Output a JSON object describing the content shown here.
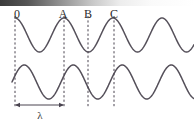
{
  "figure": {
    "width": 194,
    "height": 123,
    "background": "#ffffff",
    "stroke_color": "#55505a",
    "dash_color": "#4a4450",
    "text_color": "#2c2c2c",
    "top_band": {
      "name": "page-edge-shadow",
      "from": "#3a3a3a",
      "to": "#ffffff",
      "height": 6
    }
  },
  "labels": [
    {
      "text": "0",
      "x": 17,
      "y": 8
    },
    {
      "text": "A",
      "x": 63,
      "y": 8
    },
    {
      "text": "B",
      "x": 88,
      "y": 8
    },
    {
      "text": "C",
      "x": 114,
      "y": 8
    }
  ],
  "dashed_lines": [
    {
      "name": "marker-0",
      "x": 15,
      "y1": 16,
      "y2": 108
    },
    {
      "name": "marker-A",
      "x": 64,
      "y1": 16,
      "y2": 108
    },
    {
      "name": "marker-B",
      "x": 88,
      "y1": 16,
      "y2": 108
    },
    {
      "name": "marker-C",
      "x": 114,
      "y1": 16,
      "y2": 108
    }
  ],
  "measure": {
    "label": "λ",
    "label_x": 40,
    "label_y": 110,
    "arrow_y": 105,
    "arrow_x1": 15,
    "arrow_x2": 64
  },
  "chart_data": {
    "type": "line",
    "xlabel": "",
    "ylabel": "",
    "xlim": [
      0,
      194
    ],
    "grid": false,
    "legend": "none",
    "annotations": [
      {
        "text": "0",
        "x": 15,
        "note": "reference origin, crest of upper wave"
      },
      {
        "text": "A",
        "x": 64,
        "note": "one wavelength from 0, crest of upper wave"
      },
      {
        "text": "B",
        "x": 88,
        "note": "half wavelength past A, trough of upper wave"
      },
      {
        "text": "C",
        "x": 114,
        "note": "rising zero crossing of upper wave"
      },
      {
        "text": "λ",
        "x": 40,
        "note": "wavelength, distance from 0 to A"
      }
    ],
    "series": [
      {
        "name": "upper-wave",
        "amplitude": 17,
        "wavelength": 49,
        "baseline_y": 35,
        "phase_deg": 0,
        "phase_description": "crest at x = 15",
        "x_start": 15,
        "x_end": 194,
        "x": [
          15,
          27,
          39,
          52,
          64,
          76,
          88,
          101,
          113,
          125,
          137,
          150,
          162,
          174,
          186,
          194
        ],
        "y": [
          18,
          27,
          44,
          48,
          18,
          27,
          52,
          30,
          18,
          27,
          44,
          50,
          21,
          24,
          45,
          50
        ]
      },
      {
        "name": "lower-wave",
        "amplitude": 17,
        "wavelength": 49,
        "baseline_y": 82,
        "phase_deg": 90,
        "phase_description": "rising zero crossing at x = 15, crest a quarter wavelength later",
        "x_start": 12,
        "x_end": 194,
        "x": [
          12,
          24,
          36,
          49,
          61,
          73,
          85,
          98,
          110,
          122,
          134,
          147,
          159,
          171,
          183,
          194
        ],
        "y": [
          82,
          66,
          74,
          99,
          91,
          66,
          70,
          99,
          95,
          68,
          66,
          96,
          99,
          66,
          66,
          98
        ]
      }
    ]
  }
}
